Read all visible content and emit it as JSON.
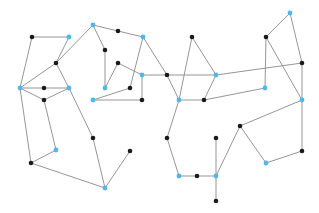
{
  "graph": {
    "colors": {
      "edge": "#8a8a8a",
      "black": "#1a1a1a",
      "blue": "#4fb8e8"
    },
    "nodes": [
      {
        "id": 0,
        "x": 32,
        "y": 37,
        "type": "black"
      },
      {
        "id": 1,
        "x": 69,
        "y": 37,
        "type": "blue"
      },
      {
        "id": 2,
        "x": 56,
        "y": 63,
        "type": "black"
      },
      {
        "id": 3,
        "x": 20,
        "y": 88,
        "type": "blue"
      },
      {
        "id": 4,
        "x": 44,
        "y": 88,
        "type": "black"
      },
      {
        "id": 5,
        "x": 69,
        "y": 88,
        "type": "blue"
      },
      {
        "id": 6,
        "x": 44,
        "y": 100,
        "type": "black"
      },
      {
        "id": 7,
        "x": 93,
        "y": 25,
        "type": "blue"
      },
      {
        "id": 8,
        "x": 118,
        "y": 31,
        "type": "black"
      },
      {
        "id": 9,
        "x": 143,
        "y": 37,
        "type": "blue"
      },
      {
        "id": 10,
        "x": 105,
        "y": 50,
        "type": "black"
      },
      {
        "id": 11,
        "x": 118,
        "y": 63,
        "type": "black"
      },
      {
        "id": 12,
        "x": 142,
        "y": 75,
        "type": "blue"
      },
      {
        "id": 13,
        "x": 105,
        "y": 88,
        "type": "blue"
      },
      {
        "id": 14,
        "x": 130,
        "y": 88,
        "type": "black"
      },
      {
        "id": 15,
        "x": 93,
        "y": 100,
        "type": "blue"
      },
      {
        "id": 16,
        "x": 142,
        "y": 100,
        "type": "black"
      },
      {
        "id": 17,
        "x": 192,
        "y": 37,
        "type": "black"
      },
      {
        "id": 18,
        "x": 167,
        "y": 75,
        "type": "black"
      },
      {
        "id": 19,
        "x": 216,
        "y": 75,
        "type": "blue"
      },
      {
        "id": 20,
        "x": 179,
        "y": 100,
        "type": "blue"
      },
      {
        "id": 21,
        "x": 204,
        "y": 100,
        "type": "black"
      },
      {
        "id": 22,
        "x": 290,
        "y": 13,
        "type": "blue"
      },
      {
        "id": 23,
        "x": 266,
        "y": 37,
        "type": "black"
      },
      {
        "id": 24,
        "x": 302,
        "y": 63,
        "type": "black"
      },
      {
        "id": 25,
        "x": 265,
        "y": 88,
        "type": "blue"
      },
      {
        "id": 26,
        "x": 302,
        "y": 100,
        "type": "blue"
      },
      {
        "id": 27,
        "x": 56,
        "y": 150,
        "type": "blue"
      },
      {
        "id": 28,
        "x": 31,
        "y": 163,
        "type": "black"
      },
      {
        "id": 29,
        "x": 93,
        "y": 138,
        "type": "black"
      },
      {
        "id": 30,
        "x": 130,
        "y": 151,
        "type": "black"
      },
      {
        "id": 31,
        "x": 105,
        "y": 188,
        "type": "blue"
      },
      {
        "id": 32,
        "x": 167,
        "y": 138,
        "type": "black"
      },
      {
        "id": 33,
        "x": 179,
        "y": 176,
        "type": "blue"
      },
      {
        "id": 34,
        "x": 197,
        "y": 176,
        "type": "black"
      },
      {
        "id": 35,
        "x": 216,
        "y": 176,
        "type": "blue"
      },
      {
        "id": 36,
        "x": 216,
        "y": 138,
        "type": "black"
      },
      {
        "id": 37,
        "x": 216,
        "y": 201,
        "type": "black"
      },
      {
        "id": 38,
        "x": 240,
        "y": 126,
        "type": "black"
      },
      {
        "id": 39,
        "x": 266,
        "y": 163,
        "type": "blue"
      },
      {
        "id": 40,
        "x": 302,
        "y": 151,
        "type": "black"
      }
    ],
    "edges": [
      [
        0,
        1
      ],
      [
        0,
        3
      ],
      [
        1,
        2
      ],
      [
        2,
        3
      ],
      [
        2,
        7
      ],
      [
        2,
        5
      ],
      [
        5,
        29
      ],
      [
        3,
        4
      ],
      [
        4,
        5
      ],
      [
        3,
        6
      ],
      [
        6,
        5
      ],
      [
        3,
        28
      ],
      [
        6,
        27
      ],
      [
        27,
        28
      ],
      [
        28,
        31
      ],
      [
        29,
        31
      ],
      [
        31,
        30
      ],
      [
        7,
        8
      ],
      [
        8,
        9
      ],
      [
        7,
        10
      ],
      [
        10,
        13
      ],
      [
        13,
        11
      ],
      [
        11,
        12
      ],
      [
        9,
        14
      ],
      [
        15,
        14
      ],
      [
        15,
        16
      ],
      [
        12,
        16
      ],
      [
        12,
        18
      ],
      [
        9,
        18
      ],
      [
        18,
        19
      ],
      [
        18,
        20
      ],
      [
        17,
        19
      ],
      [
        17,
        20
      ],
      [
        19,
        21
      ],
      [
        20,
        21
      ],
      [
        21,
        25
      ],
      [
        19,
        24
      ],
      [
        20,
        32
      ],
      [
        32,
        33
      ],
      [
        33,
        34
      ],
      [
        34,
        35
      ],
      [
        36,
        35
      ],
      [
        35,
        37
      ],
      [
        35,
        38
      ],
      [
        38,
        26
      ],
      [
        38,
        39
      ],
      [
        39,
        40
      ],
      [
        40,
        26
      ],
      [
        22,
        23
      ],
      [
        22,
        24
      ],
      [
        23,
        25
      ],
      [
        23,
        26
      ],
      [
        24,
        26
      ]
    ]
  }
}
